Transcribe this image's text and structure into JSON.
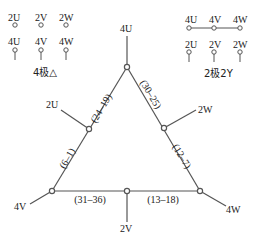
{
  "legend_left": {
    "caption": "4极△",
    "top_row": [
      "2U",
      "2V",
      "2W"
    ],
    "bottom_row": [
      "4U",
      "4V",
      "4W"
    ]
  },
  "legend_right": {
    "caption": "2极2Y",
    "top_row": [
      "4U",
      "4V",
      "4W"
    ],
    "bottom_row": [
      "2U",
      "2V",
      "2W"
    ]
  },
  "diagram": {
    "terminals": {
      "top": "4U",
      "left_mid": "2U",
      "right_mid": "2W",
      "bottom_left": "4V",
      "bottom_mid": "2V",
      "bottom_right": "4W"
    },
    "coils": {
      "left_upper": "(24–19)",
      "left_lower": "(6–1)",
      "right_upper": "(30–25)",
      "right_lower": "(12–7)",
      "bottom_left": "(31–36)",
      "bottom_right": "(13–18)"
    },
    "line_color": "#555555"
  }
}
